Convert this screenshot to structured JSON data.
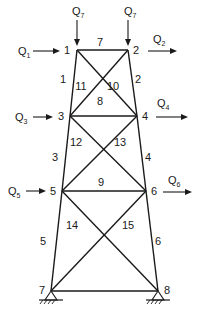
{
  "diagram": {
    "type": "plane-truss-tower",
    "nodes": [
      {
        "id": "1",
        "label": "1",
        "x": 77,
        "y": 50,
        "label_x": 64,
        "label_y": 54
      },
      {
        "id": "2",
        "label": "2",
        "x": 128,
        "y": 50,
        "label_x": 133,
        "label_y": 54
      },
      {
        "id": "3",
        "label": "3",
        "x": 70,
        "y": 116,
        "label_x": 58,
        "label_y": 120
      },
      {
        "id": "4",
        "label": "4",
        "x": 137,
        "y": 116,
        "label_x": 142,
        "label_y": 120
      },
      {
        "id": "5",
        "label": "5",
        "x": 62,
        "y": 191,
        "label_x": 50,
        "label_y": 195
      },
      {
        "id": "6",
        "label": "6",
        "x": 146,
        "y": 191,
        "label_x": 151,
        "label_y": 195
      },
      {
        "id": "7",
        "label": "7",
        "x": 51,
        "y": 291,
        "label_x": 39,
        "label_y": 294
      },
      {
        "id": "8",
        "label": "8",
        "x": 158,
        "y": 291,
        "label_x": 164,
        "label_y": 294
      }
    ],
    "members": [
      {
        "id": "1",
        "label": "1",
        "from": "1",
        "to": "3",
        "label_x": 63,
        "label_y": 83
      },
      {
        "id": "2",
        "label": "2",
        "from": "2",
        "to": "4",
        "label_x": 138,
        "label_y": 83
      },
      {
        "id": "3",
        "label": "3",
        "from": "3",
        "to": "5",
        "label_x": 55,
        "label_y": 161
      },
      {
        "id": "4",
        "label": "4",
        "from": "4",
        "to": "6",
        "label_x": 148,
        "label_y": 161
      },
      {
        "id": "5",
        "label": "5",
        "from": "5",
        "to": "7",
        "label_x": 43,
        "label_y": 245
      },
      {
        "id": "6",
        "label": "6",
        "from": "6",
        "to": "8",
        "label_x": 158,
        "label_y": 245
      },
      {
        "id": "7",
        "label": "7",
        "from": "1",
        "to": "2",
        "label_x": 100,
        "label_y": 46
      },
      {
        "id": "8",
        "label": "8",
        "from": "3",
        "to": "4",
        "label_x": 100,
        "label_y": 105
      },
      {
        "id": "9",
        "label": "9",
        "from": "5",
        "to": "6",
        "label_x": 101,
        "label_y": 186
      },
      {
        "id": "10",
        "label": "10",
        "from": "1",
        "to": "4",
        "label_x": 113,
        "label_y": 90
      },
      {
        "id": "11",
        "label": "11",
        "from": "2",
        "to": "3",
        "label_x": 81,
        "label_y": 90
      },
      {
        "id": "12",
        "label": "12",
        "from": "3",
        "to": "6",
        "label_x": 76,
        "label_y": 146
      },
      {
        "id": "13",
        "label": "13",
        "from": "4",
        "to": "5",
        "label_x": 120,
        "label_y": 146
      },
      {
        "id": "14",
        "label": "14",
        "from": "5",
        "to": "8",
        "label_x": 72,
        "label_y": 229
      },
      {
        "id": "15",
        "label": "15",
        "from": "6",
        "to": "7",
        "label_x": 128,
        "label_y": 229
      }
    ],
    "loads": [
      {
        "id": "Q1",
        "base": "Q",
        "sub": "1",
        "node": "1",
        "direction": "right",
        "x1": 33,
        "y1": 51,
        "x2": 60,
        "y2": 51,
        "label_x": 18,
        "label_y": 55
      },
      {
        "id": "Q2",
        "base": "Q",
        "sub": "2",
        "node": "2",
        "direction": "right",
        "x1": 148,
        "y1": 51,
        "x2": 177,
        "y2": 51,
        "label_x": 153,
        "label_y": 43
      },
      {
        "id": "Q3",
        "base": "Q",
        "sub": "3",
        "node": "3",
        "direction": "right",
        "x1": 33,
        "y1": 117,
        "x2": 53,
        "y2": 117,
        "label_x": 15,
        "label_y": 121
      },
      {
        "id": "Q4",
        "base": "Q",
        "sub": "4",
        "node": "4",
        "direction": "right",
        "x1": 156,
        "y1": 117,
        "x2": 188,
        "y2": 117,
        "label_x": 157,
        "label_y": 107
      },
      {
        "id": "Q5",
        "base": "Q",
        "sub": "5",
        "node": "5",
        "direction": "right",
        "x1": 26,
        "y1": 191,
        "x2": 46,
        "y2": 191,
        "label_x": 8,
        "label_y": 195
      },
      {
        "id": "Q6",
        "base": "Q",
        "sub": "6",
        "node": "6",
        "direction": "right",
        "x1": 163,
        "y1": 192,
        "x2": 192,
        "y2": 192,
        "label_x": 168,
        "label_y": 184
      },
      {
        "id": "Q7a",
        "base": "Q",
        "sub": "7",
        "node": "1",
        "direction": "down",
        "x1": 77,
        "y1": 20,
        "x2": 77,
        "y2": 46,
        "label_x": 72,
        "label_y": 15
      },
      {
        "id": "Q7b",
        "base": "Q",
        "sub": "7",
        "node": "2",
        "direction": "down",
        "x1": 128,
        "y1": 20,
        "x2": 128,
        "y2": 46,
        "label_x": 124,
        "label_y": 15
      }
    ],
    "supports": [
      {
        "id": "support-7",
        "node": "7",
        "type": "pin",
        "x": 51,
        "y": 291
      },
      {
        "id": "support-8",
        "node": "8",
        "type": "pin",
        "x": 158,
        "y": 291
      }
    ]
  }
}
